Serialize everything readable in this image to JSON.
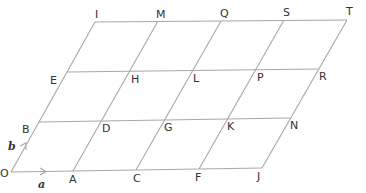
{
  "diagram": {
    "type": "parallelogram-grid",
    "grid": {
      "columns": 4,
      "rows": 3
    },
    "colors": {
      "lines": "#a8a8a8",
      "text": "#333333",
      "background": "#ffffff"
    },
    "vectors": [
      {
        "name": "a",
        "label": "a",
        "from": "O",
        "to": "A"
      },
      {
        "name": "b",
        "label": "b",
        "from": "O",
        "to": "B"
      }
    ],
    "points": {
      "O": "O",
      "A": "A",
      "C": "C",
      "F": "F",
      "J": "J",
      "B": "B",
      "D": "D",
      "G": "G",
      "K": "K",
      "N": "N",
      "E": "E",
      "H": "H",
      "L": "L",
      "P": "P",
      "R": "R",
      "I": "I",
      "M": "M",
      "Q": "Q",
      "S": "S",
      "T": "T"
    },
    "rows": [
      [
        "O",
        "A",
        "C",
        "F",
        "J"
      ],
      [
        "B",
        "D",
        "G",
        "K",
        "N"
      ],
      [
        "E",
        "H",
        "L",
        "P",
        "R"
      ],
      [
        "I",
        "M",
        "Q",
        "S",
        "T"
      ]
    ]
  }
}
